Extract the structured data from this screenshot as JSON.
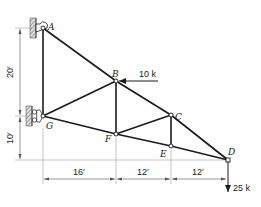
{
  "figure": {
    "type": "plane truss",
    "joints": {
      "A": {
        "label": "A"
      },
      "B": {
        "label": "B"
      },
      "C": {
        "label": "C"
      },
      "D": {
        "label": "D"
      },
      "E": {
        "label": "E"
      },
      "F": {
        "label": "F"
      },
      "G": {
        "label": "G"
      }
    },
    "members": [
      "AG",
      "AB",
      "BC",
      "CD",
      "GF",
      "FE",
      "ED",
      "GB",
      "BF",
      "FC",
      "CE"
    ],
    "supports": {
      "A": "pin to wall",
      "G": "roller on wall"
    },
    "loads": [
      {
        "joint": "B",
        "label": "10 k",
        "direction": "left"
      },
      {
        "joint": "D",
        "label": "25 k",
        "direction": "down"
      }
    ],
    "dimensions": {
      "vertical": [
        {
          "label": "20′"
        },
        {
          "label": "10′"
        }
      ],
      "horizontal": [
        {
          "label": "16′"
        },
        {
          "label": "12′"
        },
        {
          "label": "12′"
        }
      ]
    }
  }
}
